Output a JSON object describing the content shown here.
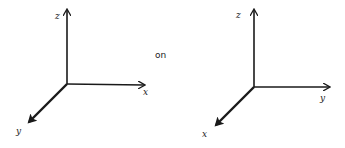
{
  "diagrams": [
    {
      "name": "left-axes",
      "labels": {
        "up": "z",
        "right": "x",
        "diagonal": "y"
      }
    },
    {
      "name": "right-axes",
      "labels": {
        "up": "z",
        "right": "y",
        "diagonal": "x"
      }
    }
  ],
  "connector": "on",
  "colors": {
    "stroke": "#1a1a1a",
    "background": "#ffffff"
  }
}
